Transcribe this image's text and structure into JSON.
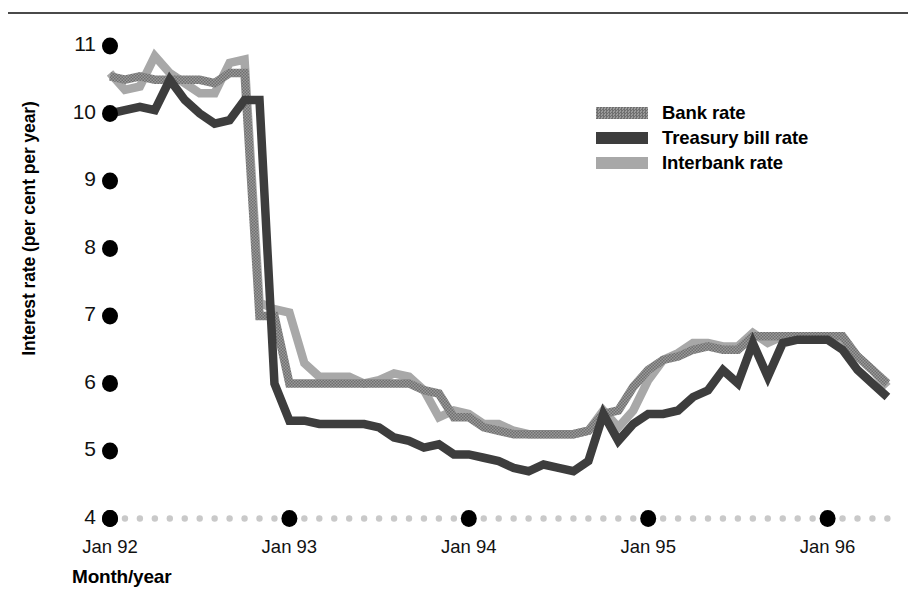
{
  "figure": {
    "ylabel": "Interest rate (per cent per year)",
    "xlabel": "Month/year"
  },
  "legend": {
    "items": [
      {
        "label": "Bank rate",
        "color": "#8c8c8c",
        "pattern": "dotted"
      },
      {
        "label": "Treasury bill rate",
        "color": "#3d3d3d",
        "pattern": "solid"
      },
      {
        "label": "Interbank rate",
        "color": "#a8a8a8",
        "pattern": "solid"
      }
    ]
  },
  "yticks": [
    {
      "label": "11",
      "value": 11
    },
    {
      "label": "10",
      "value": 10
    },
    {
      "label": "9",
      "value": 9
    },
    {
      "label": "8",
      "value": 8
    },
    {
      "label": "7",
      "value": 7
    },
    {
      "label": "6",
      "value": 6
    },
    {
      "label": "5",
      "value": 5
    },
    {
      "label": "4",
      "value": 4
    }
  ],
  "xticks": [
    {
      "label": "Jan 92",
      "index": 0
    },
    {
      "label": "Jan 93",
      "index": 12
    },
    {
      "label": "Jan 94",
      "index": 24
    },
    {
      "label": "Jan 95",
      "index": 36
    },
    {
      "label": "Jan 96",
      "index": 48
    }
  ],
  "chart_data": {
    "type": "line",
    "title": "",
    "xlabel": "Month/year",
    "ylabel": "Interest rate (per cent per year)",
    "ylim": [
      4,
      11
    ],
    "xlim": [
      0,
      52
    ],
    "grid": false,
    "legend_position": "upper-right",
    "x": [
      "Jan 92",
      "Feb 92",
      "Mar 92",
      "Apr 92",
      "May 92",
      "Jun 92",
      "Jul 92",
      "Aug 92",
      "Sep 92",
      "Oct 92",
      "Nov 92",
      "Dec 92",
      "Jan 93",
      "Feb 93",
      "Mar 93",
      "Apr 93",
      "May 93",
      "Jun 93",
      "Jul 93",
      "Aug 93",
      "Sep 93",
      "Oct 93",
      "Nov 93",
      "Dec 93",
      "Jan 94",
      "Feb 94",
      "Mar 94",
      "Apr 94",
      "May 94",
      "Jun 94",
      "Jul 94",
      "Aug 94",
      "Sep 94",
      "Oct 94",
      "Nov 94",
      "Dec 94",
      "Jan 95",
      "Feb 95",
      "Mar 95",
      "Apr 95",
      "May 95",
      "Jun 95",
      "Jul 95",
      "Aug 95",
      "Sep 95",
      "Oct 95",
      "Nov 95",
      "Dec 95",
      "Jan 96",
      "Feb 96",
      "Mar 96",
      "Apr 96",
      "May 96"
    ],
    "series": [
      {
        "name": "Bank rate",
        "color": "#8c8c8c",
        "values": [
          10.55,
          10.5,
          10.55,
          10.5,
          10.5,
          10.5,
          10.5,
          10.45,
          10.6,
          10.6,
          7.0,
          7.0,
          6.0,
          6.0,
          6.0,
          6.0,
          6.0,
          6.0,
          6.0,
          6.0,
          6.0,
          5.9,
          5.85,
          5.5,
          5.5,
          5.35,
          5.3,
          5.25,
          5.25,
          5.25,
          5.25,
          5.25,
          5.3,
          5.55,
          5.6,
          5.95,
          6.2,
          6.35,
          6.4,
          6.5,
          6.55,
          6.5,
          6.5,
          6.7,
          6.7,
          6.7,
          6.7,
          6.7,
          6.7,
          6.7,
          6.4,
          6.2,
          6.0
        ]
      },
      {
        "name": "Treasury bill rate",
        "color": "#3d3d3d",
        "values": [
          10.0,
          10.05,
          10.1,
          10.05,
          10.5,
          10.2,
          10.0,
          9.85,
          9.9,
          10.2,
          10.2,
          6.0,
          5.45,
          5.45,
          5.4,
          5.4,
          5.4,
          5.4,
          5.35,
          5.2,
          5.15,
          5.05,
          5.1,
          4.95,
          4.95,
          4.9,
          4.85,
          4.75,
          4.7,
          4.8,
          4.75,
          4.7,
          4.85,
          5.55,
          5.15,
          5.4,
          5.55,
          5.55,
          5.6,
          5.8,
          5.9,
          6.2,
          6.0,
          6.6,
          6.1,
          6.6,
          6.65,
          6.65,
          6.65,
          6.5,
          6.2,
          6.0,
          5.8
        ]
      },
      {
        "name": "Interbank rate",
        "color": "#a8a8a8",
        "values": [
          10.6,
          10.35,
          10.4,
          10.85,
          10.6,
          10.45,
          10.3,
          10.3,
          10.75,
          10.8,
          7.2,
          7.1,
          7.05,
          6.3,
          6.1,
          6.1,
          6.1,
          6.0,
          6.05,
          6.15,
          6.1,
          5.9,
          5.5,
          5.6,
          5.55,
          5.4,
          5.4,
          5.3,
          5.25,
          5.25,
          5.25,
          5.25,
          5.3,
          5.6,
          5.35,
          5.6,
          6.05,
          6.35,
          6.45,
          6.6,
          6.6,
          6.55,
          6.55,
          6.75,
          6.6,
          6.7,
          6.7,
          6.7,
          6.7,
          6.65,
          6.4,
          6.2,
          5.95
        ]
      }
    ]
  }
}
